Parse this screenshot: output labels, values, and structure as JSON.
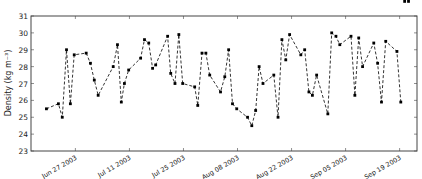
{
  "chart_data": {
    "type": "line",
    "title": "",
    "xlabel": "",
    "ylabel": "Density (kg m⁻³)",
    "ylim": [
      23,
      31
    ],
    "yticks": [
      23,
      24,
      25,
      26,
      27,
      28,
      29,
      30,
      31
    ],
    "xtick_labels": [
      "Jun 27 2003",
      "Jul 11 2003",
      "Jul 25 2003",
      "Aug 08 2003",
      "Aug 22 2003",
      "Sep 05 2003",
      "Sep 19 2003"
    ],
    "xtick_day_offsets": [
      0,
      14,
      28,
      42,
      56,
      70,
      84
    ],
    "x_day_range": [
      -11.5,
      88.5
    ],
    "grid": false,
    "legend": null,
    "line_style": "dashed",
    "marker": "square",
    "color": "#000000",
    "series": [
      {
        "name": "density",
        "day_offsets": [
          -7.5,
          -4.4,
          -3.4,
          -2.3,
          -1.3,
          -0.3,
          2.8,
          3.9,
          4.9,
          5.9,
          9.8,
          10.9,
          11.9,
          12.7,
          13.8,
          16.9,
          17.9,
          19.0,
          20.0,
          20.8,
          23.9,
          24.7,
          25.8,
          26.8,
          27.8,
          30.9,
          31.7,
          32.8,
          33.8,
          34.8,
          37.6,
          38.7,
          39.7,
          40.7,
          41.8,
          44.6,
          45.7,
          46.7,
          47.6,
          48.6,
          51.4,
          52.5,
          53.5,
          54.5,
          55.5,
          58.4,
          59.4,
          60.5,
          61.4,
          62.5,
          65.4,
          66.4,
          67.5,
          68.5,
          71.4,
          72.4,
          73.4,
          74.4,
          77.3,
          78.3,
          79.3,
          80.4,
          83.3,
          84.3,
          85.3,
          86.3
        ],
        "values": [
          25.5,
          25.8,
          25.0,
          29.0,
          25.8,
          28.7,
          28.8,
          28.2,
          27.2,
          26.3,
          28.0,
          29.3,
          25.9,
          27.0,
          27.8,
          28.5,
          29.6,
          29.4,
          27.9,
          28.1,
          29.8,
          27.6,
          27.0,
          29.9,
          27.0,
          26.8,
          25.7,
          28.8,
          28.8,
          27.5,
          26.5,
          27.4,
          29.0,
          25.8,
          25.5,
          25.0,
          24.5,
          25.4,
          28.0,
          27.0,
          27.5,
          25.0,
          29.6,
          28.4,
          29.9,
          28.7,
          29.0,
          26.5,
          26.3,
          27.5,
          25.2,
          30.0,
          29.8,
          29.3,
          29.8,
          26.3,
          29.7,
          28.0,
          29.4,
          28.2,
          25.9,
          29.5,
          28.9,
          25.9
        ]
      }
    ]
  }
}
